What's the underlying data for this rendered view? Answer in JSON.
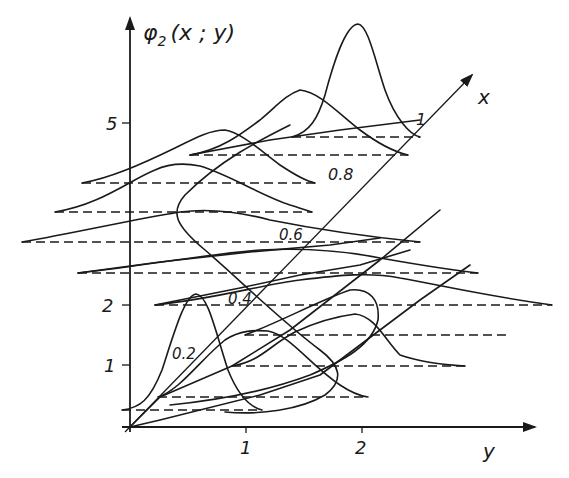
{
  "figure": {
    "vertical_axis_label": "φ",
    "vertical_axis_subscript": "2",
    "vertical_axis_args": "(x ; y)",
    "horizontal_axis_label": "y",
    "oblique_axis_label": "x",
    "vertical_ticks": [
      "1",
      "2",
      "5"
    ],
    "horizontal_ticks": [
      "1",
      "2"
    ],
    "oblique_ticks": [
      "0.2",
      "0.4",
      "0.6",
      "0.8",
      "1"
    ]
  },
  "colors": {
    "ink": "#1a1a1a",
    "paper": "#ffffff"
  }
}
